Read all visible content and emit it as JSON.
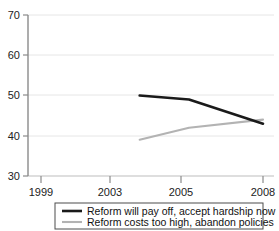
{
  "chart_data": {
    "type": "line",
    "title": "",
    "subtitle": "",
    "xlabel": "",
    "ylabel": "",
    "x": [
      2003,
      2005,
      2008
    ],
    "xtick_labels": [
      "1999",
      "2003",
      "2005",
      "2008"
    ],
    "xtick_values": [
      1999,
      2003,
      2005,
      2008
    ],
    "ytick_labels": [
      "30",
      "40",
      "50",
      "60",
      "70"
    ],
    "ytick_values": [
      30,
      40,
      50,
      60,
      70
    ],
    "xlim": [
      1999,
      2008
    ],
    "ylim": [
      30,
      70
    ],
    "grid": "horizontal",
    "legend_position": "bottom",
    "series": [
      {
        "name": "Reform will pay off, accept hardship now",
        "color": "#1a1a1a",
        "x": [
          2003,
          2005,
          2008
        ],
        "values": [
          50,
          49,
          43
        ]
      },
      {
        "name": "Reform costs too high, abandon policies",
        "color": "#b3b3b3",
        "x": [
          2003,
          2005,
          2008
        ],
        "values": [
          39,
          42,
          44
        ]
      }
    ]
  },
  "legend": {
    "items": [
      {
        "label": "Reform will pay off, accept hardship now",
        "color": "#1a1a1a"
      },
      {
        "label": "Reform costs too high, abandon policies",
        "color": "#b3b3b3"
      }
    ]
  },
  "axis": {
    "y_labels": [
      "70",
      "60",
      "50",
      "40",
      "30"
    ],
    "x_labels": [
      "1999",
      "2003",
      "2005",
      "2008"
    ]
  },
  "colors": {
    "series_1": "#1a1a1a",
    "series_2": "#b3b3b3",
    "grid": "#e6e6e6",
    "axis": "#808080",
    "text": "#222222",
    "background": "#ffffff"
  }
}
